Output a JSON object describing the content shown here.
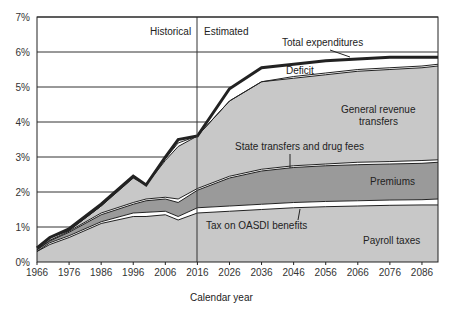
{
  "chart_data": {
    "type": "area",
    "title": "",
    "xlabel": "Calendar year",
    "ylabel": "",
    "ylim": [
      0,
      7
    ],
    "xlim": [
      1966,
      2091
    ],
    "yticks": [
      "0%",
      "1%",
      "2%",
      "3%",
      "4%",
      "5%",
      "6%",
      "7%"
    ],
    "xticks": [
      "1966",
      "1976",
      "1986",
      "1996",
      "2006",
      "2016",
      "2026",
      "2036",
      "2046",
      "2056",
      "2066",
      "2076",
      "2086"
    ],
    "grid": "horizontal",
    "divider": {
      "year": 2016,
      "left_label": "Historical",
      "right_label": "Estimated"
    },
    "x": [
      1966,
      1970,
      1976,
      1986,
      1996,
      2000,
      2006,
      2010,
      2016,
      2026,
      2036,
      2046,
      2056,
      2066,
      2076,
      2086,
      2091
    ],
    "series": [
      {
        "name": "Payroll taxes",
        "values": [
          0.3,
          0.5,
          0.7,
          1.1,
          1.3,
          1.3,
          1.35,
          1.2,
          1.4,
          1.45,
          1.5,
          1.55,
          1.58,
          1.6,
          1.62,
          1.63,
          1.63
        ]
      },
      {
        "name": "Tax on OASDI benefits",
        "values": [
          0.3,
          0.55,
          0.75,
          1.15,
          1.4,
          1.42,
          1.45,
          1.3,
          1.55,
          1.6,
          1.65,
          1.7,
          1.73,
          1.75,
          1.77,
          1.78,
          1.8
        ]
      },
      {
        "name": "Premiums",
        "values": [
          0.35,
          0.6,
          0.85,
          1.35,
          1.65,
          1.75,
          1.8,
          1.7,
          2.05,
          2.4,
          2.6,
          2.7,
          2.75,
          2.78,
          2.8,
          2.82,
          2.85
        ]
      },
      {
        "name": "State transfers and drug fees",
        "values": [
          0.35,
          0.62,
          0.88,
          1.4,
          1.7,
          1.8,
          1.85,
          1.8,
          2.1,
          2.45,
          2.65,
          2.75,
          2.8,
          2.85,
          2.87,
          2.9,
          2.92
        ]
      },
      {
        "name": "General revenue transfers",
        "values": [
          0.4,
          0.7,
          0.9,
          1.6,
          2.4,
          2.2,
          2.9,
          3.3,
          3.6,
          4.6,
          5.15,
          5.25,
          5.35,
          5.45,
          5.5,
          5.55,
          5.6
        ]
      },
      {
        "name": "Deficit",
        "values": [
          0.4,
          0.7,
          0.9,
          1.6,
          2.45,
          2.2,
          2.95,
          3.4,
          3.6,
          4.6,
          5.15,
          5.3,
          5.4,
          5.5,
          5.55,
          5.6,
          5.65
        ]
      },
      {
        "name": "Total expenditures",
        "values": [
          0.4,
          0.7,
          0.95,
          1.65,
          2.45,
          2.2,
          3.0,
          3.5,
          3.6,
          4.95,
          5.55,
          5.65,
          5.75,
          5.8,
          5.85,
          5.85,
          5.85
        ]
      }
    ],
    "annotations": [
      "Total expenditures",
      "Deficit",
      "General revenue transfers",
      "State transfers and drug fees",
      "Premiums",
      "Tax on OASDI benefits",
      "Payroll taxes"
    ]
  }
}
